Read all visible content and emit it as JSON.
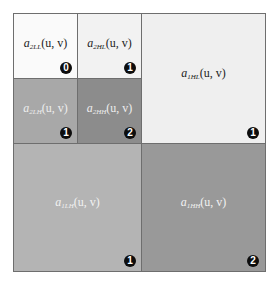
{
  "diagram": {
    "subbands": [
      {
        "id": "2LL",
        "prefix": "a",
        "sub": "2LL",
        "args": "(u, v)",
        "level_badge": "0",
        "fill": "#fafafa",
        "text_color": "#222222"
      },
      {
        "id": "2HL",
        "prefix": "a",
        "sub": "2HL",
        "args": "(u, v)",
        "level_badge": "1",
        "fill": "#f2f2f2",
        "text_color": "#222222"
      },
      {
        "id": "2LH",
        "prefix": "a",
        "sub": "2LH",
        "args": "(u, v)",
        "level_badge": "1",
        "fill": "#a8a8a8",
        "text_color": "#eeeeee"
      },
      {
        "id": "2HH",
        "prefix": "a",
        "sub": "2HH",
        "args": "(u, v)",
        "level_badge": "2",
        "fill": "#8c8c8c",
        "text_color": "#eeeeee"
      },
      {
        "id": "1HL",
        "prefix": "a",
        "sub": "1HL",
        "args": "(u, v)",
        "level_badge": "1",
        "fill": "#efefef",
        "text_color": "#222222"
      },
      {
        "id": "1LH",
        "prefix": "a",
        "sub": "1LH",
        "args": "(u, v)",
        "level_badge": "1",
        "fill": "#b4b4b4",
        "text_color": "#f2f2f2"
      },
      {
        "id": "1HH",
        "prefix": "a",
        "sub": "1HH",
        "args": "(u, v)",
        "level_badge": "2",
        "fill": "#999999",
        "text_color": "#f2f2f2"
      }
    ],
    "border_color": "#6e6e6e",
    "badge_color": "#0d0d0d"
  }
}
